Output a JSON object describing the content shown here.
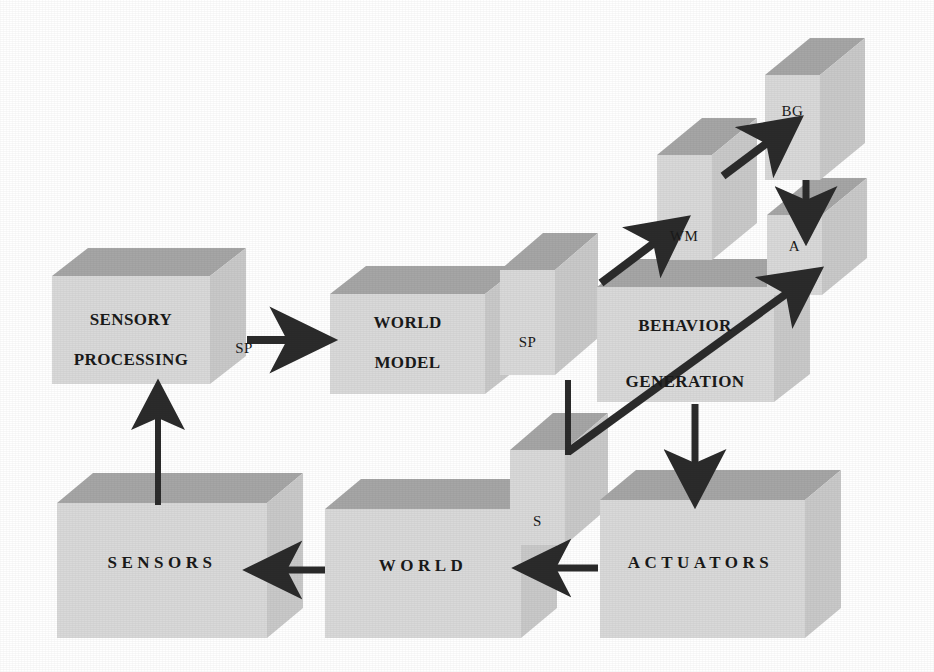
{
  "diagram": {
    "background_color": "#ffffff",
    "palette": {
      "box_front": "#d9d9d9",
      "box_top": "#a6a6a6",
      "box_side": "#cbcbcb",
      "arrow": "#2b2b2b",
      "text": "#1a1a1a"
    },
    "nodes": [
      {
        "id": "sensory-processing",
        "label_line1": "SENSORY",
        "label_line2": "PROCESSING",
        "style": "large",
        "x": 52,
        "y": 276,
        "w": 158,
        "h": 108
      },
      {
        "id": "world-model",
        "label_line1": "WORLD",
        "label_line2": "MODEL",
        "style": "large",
        "x": 330,
        "y": 294,
        "w": 155,
        "h": 100
      },
      {
        "id": "behavior-generation",
        "label_line1": "BEHAVIOR",
        "label_line2": "GENERATION",
        "style": "large",
        "x": 597,
        "y": 287,
        "w": 177,
        "h": 115
      },
      {
        "id": "sensors",
        "label_line1": "SENSORS",
        "label_line2": "",
        "style": "wide",
        "x": 57,
        "y": 503,
        "w": 210,
        "h": 135
      },
      {
        "id": "world",
        "label_line1": "WORLD",
        "label_line2": "",
        "style": "wide",
        "x": 325,
        "y": 509,
        "w": 196,
        "h": 129
      },
      {
        "id": "actuators",
        "label_line1": "ACTUATORS",
        "label_line2": "",
        "style": "wide",
        "x": 600,
        "y": 500,
        "w": 205,
        "h": 138
      }
    ],
    "small_nodes": [
      {
        "id": "sp-small",
        "label": "SP",
        "x": 500,
        "y": 270,
        "w": 55,
        "h": 105
      },
      {
        "id": "wm-small",
        "label": "WM",
        "x": 657,
        "y": 155,
        "w": 55,
        "h": 105
      },
      {
        "id": "bg-small",
        "label": "BG",
        "x": 765,
        "y": 75,
        "w": 55,
        "h": 105
      },
      {
        "id": "a-small",
        "label": "A",
        "x": 767,
        "y": 215,
        "w": 55,
        "h": 80
      },
      {
        "id": "s-small",
        "label": "S",
        "x": 510,
        "y": 450,
        "w": 55,
        "h": 95
      }
    ],
    "edge_labels": [
      {
        "id": "sp-label-left",
        "label": "SP",
        "x": 229,
        "y": 340
      }
    ],
    "arrows": [
      {
        "id": "sensors-to-sensory-processing",
        "from": "sensors",
        "to": "sensory-processing",
        "direction": "up"
      },
      {
        "id": "sensory-processing-to-world-model",
        "from": "sensory-processing",
        "to": "world-model",
        "direction": "right"
      },
      {
        "id": "sp-small-to-wm-small",
        "from": "sp-small",
        "to": "wm-small",
        "direction": "up-right"
      },
      {
        "id": "wm-small-to-bg-small",
        "from": "wm-small",
        "to": "bg-small",
        "direction": "up-right"
      },
      {
        "id": "bg-small-to-a-small",
        "from": "bg-small",
        "to": "a-small",
        "direction": "down"
      },
      {
        "id": "behavior-generation-to-actuators",
        "from": "behavior-generation",
        "to": "actuators",
        "direction": "down"
      },
      {
        "id": "s-small-to-a-small",
        "from": "s-small",
        "to": "a-small",
        "direction": "up-right"
      },
      {
        "id": "actuators-to-world",
        "from": "actuators",
        "to": "world",
        "direction": "left"
      },
      {
        "id": "world-to-sensors",
        "from": "world",
        "to": "sensors",
        "direction": "left"
      }
    ],
    "connectors": [
      {
        "id": "sp-small-to-s-small",
        "from": "sp-small",
        "to": "s-small",
        "style": "plain-line"
      }
    ]
  }
}
